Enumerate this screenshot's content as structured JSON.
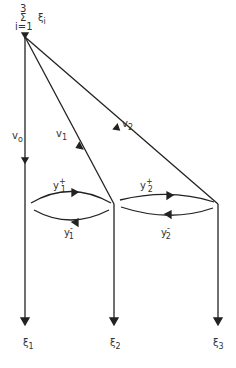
{
  "source": {
    "top": "3",
    "sigma": "Σ",
    "bottom": "i=1",
    "term": "ξ",
    "term_sub": "i"
  },
  "edges": {
    "v0": {
      "base": "v",
      "sub": "o"
    },
    "v1": {
      "base": "v",
      "sub": "1"
    },
    "v2": {
      "base": "v",
      "sub": "2"
    },
    "y1p": {
      "base": "y",
      "sub": "1",
      "sup": "+"
    },
    "y1m": {
      "base": "y",
      "sub": "1",
      "sup": "-"
    },
    "y2p": {
      "base": "y",
      "sub": "2",
      "sup": "+"
    },
    "y2m": {
      "base": "y",
      "sub": "2",
      "sup": "-"
    }
  },
  "sinks": [
    {
      "base": "ξ",
      "sub": "1"
    },
    {
      "base": "ξ",
      "sub": "2"
    },
    {
      "base": "ξ",
      "sub": "3"
    }
  ]
}
